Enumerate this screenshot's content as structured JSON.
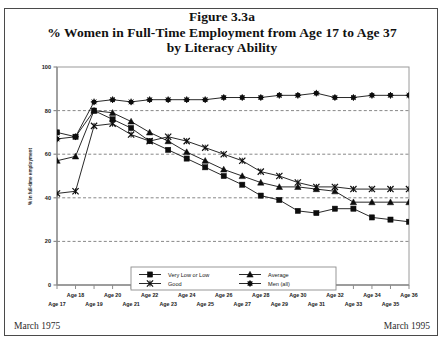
{
  "figure": {
    "title_line1": "Figure 3.3a",
    "title_line2": "% Women in Full-Time Employment from Age 17 to Age 37",
    "title_line3": "by Literacy Ability"
  },
  "footer": {
    "left": "March 1975",
    "right": "March 1995"
  },
  "chart_data": {
    "type": "line",
    "title": "% Women in Full-Time Employment from Age 17 to Age 37 by Literacy Ability",
    "subtitle": "Figure 3.3a",
    "xlabel": "",
    "ylabel": "% in full-time employment",
    "ylim": [
      0,
      100
    ],
    "yticks": [
      0,
      20,
      40,
      60,
      80,
      100
    ],
    "grid": "horizontal-dashed",
    "legend_position": "bottom-center",
    "categories": [
      "Age 17",
      "Age 18",
      "Age 19",
      "Age 20",
      "Age 21",
      "Age 22",
      "Age 23",
      "Age 24",
      "Age 25",
      "Age 26",
      "Age 27",
      "Age 28",
      "Age 29",
      "Age 30",
      "Age 31",
      "Age 32",
      "Age 33",
      "Age 34",
      "Age 35",
      "Age 36"
    ],
    "series": [
      {
        "name": "Very Low or Low",
        "marker": "filled-square",
        "values": [
          70,
          68,
          80,
          76,
          72,
          66,
          62,
          58,
          54,
          50,
          46,
          41,
          39,
          34,
          33,
          35,
          35,
          31,
          30,
          29
        ]
      },
      {
        "name": "Good",
        "marker": "x-cross",
        "values": [
          42,
          43,
          73,
          74,
          69,
          66,
          68,
          66,
          63,
          60,
          57,
          52,
          50,
          47,
          45,
          45,
          44,
          44,
          44,
          44
        ]
      },
      {
        "name": "Average",
        "marker": "filled-triangle",
        "values": [
          57,
          59,
          80,
          79,
          75,
          70,
          66,
          61,
          57,
          53,
          50,
          47,
          45,
          45,
          44,
          43,
          38,
          38,
          38,
          38
        ]
      },
      {
        "name": "Men (all)",
        "marker": "filled-circle",
        "values": [
          67,
          68,
          84,
          85,
          84,
          85,
          85,
          85,
          85,
          86,
          86,
          86,
          87,
          87,
          88,
          86,
          86,
          87,
          87,
          87
        ]
      }
    ]
  },
  "legend": {
    "entries": [
      {
        "label": "Very Low or Low",
        "marker": "filled-square"
      },
      {
        "label": "Average",
        "marker": "filled-triangle"
      },
      {
        "label": "Good",
        "marker": "x-cross"
      },
      {
        "label": "Men (all)",
        "marker": "filled-circle"
      }
    ]
  }
}
